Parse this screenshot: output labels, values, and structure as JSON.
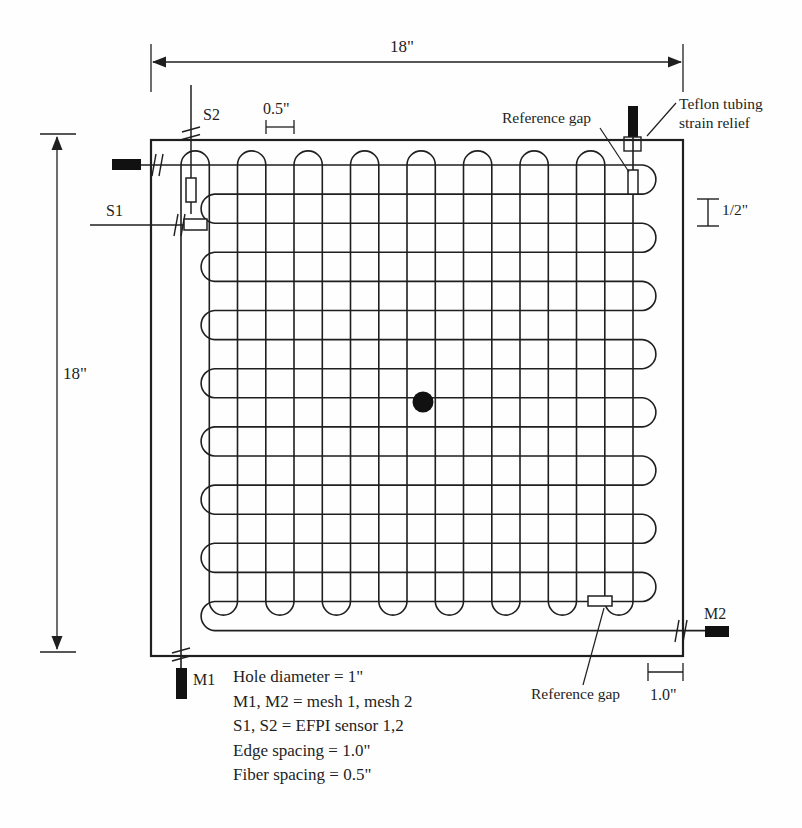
{
  "figure": {
    "title_hint": "Sensor mesh panel layout diagram",
    "dimensions": {
      "top_width": "18\"",
      "left_height": "18\"",
      "fiber_spacing": "0.5\"",
      "half_spacing": "1/2\"",
      "edge_spacing": "1.0\""
    },
    "labels": {
      "s1": "S1",
      "s2": "S2",
      "m1": "M1",
      "m2": "M2",
      "reference_gap_top": "Reference gap",
      "reference_gap_bottom": "Reference gap",
      "strain_relief_line1": "Teflon tubing",
      "strain_relief_line2": "strain relief"
    },
    "legend": {
      "line1": "Hole diameter = 1\"",
      "line2": "M1, M2 = mesh 1, mesh 2",
      "line3": "S1, S2 = EFPI sensor 1,2",
      "line4": "Edge spacing = 1.0\"",
      "line5": "Fiber spacing = 0.5\""
    },
    "colors": {
      "line": "#1f1f1f",
      "background": "#ffffff",
      "rod_fill": "#111111"
    }
  }
}
